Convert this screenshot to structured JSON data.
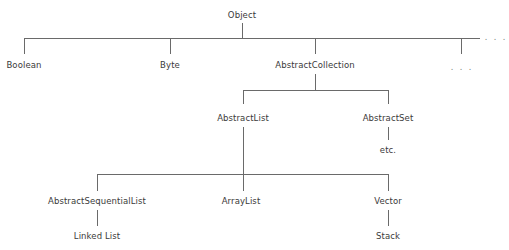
{
  "diagram": {
    "nodes": {
      "object": "Object",
      "boolean": "Boolean",
      "byte": "Byte",
      "abstract_collection": "AbstractCollection",
      "ellipsis_child": ". . .",
      "ellipsis_right": ". . .",
      "abstract_list": "AbstractList",
      "abstract_set": "AbstractSet",
      "etc": "etc.",
      "abstract_sequential_list": "AbstractSequentialList",
      "array_list": "ArrayList",
      "vector": "Vector",
      "linked_list": "Linked List",
      "stack": "Stack"
    },
    "edges": [
      [
        "Object",
        "Boolean"
      ],
      [
        "Object",
        "Byte"
      ],
      [
        "Object",
        "AbstractCollection"
      ],
      [
        "Object",
        ". . ."
      ],
      [
        "AbstractCollection",
        "AbstractList"
      ],
      [
        "AbstractCollection",
        "AbstractSet"
      ],
      [
        "AbstractSet",
        "etc."
      ],
      [
        "AbstractList",
        "AbstractSequentialList"
      ],
      [
        "AbstractList",
        "ArrayList"
      ],
      [
        "AbstractList",
        "Vector"
      ],
      [
        "AbstractSequentialList",
        "Linked List"
      ],
      [
        "Vector",
        "Stack"
      ]
    ],
    "colors": {
      "line": "#6a6a6a",
      "text": "#3a3a3a",
      "background": "#ffffff"
    }
  }
}
